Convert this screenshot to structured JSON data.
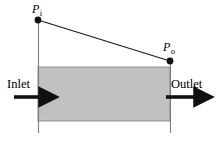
{
  "figure": {
    "title": "",
    "labels": {
      "pressure_inlet": "P",
      "pressure_inlet_sub": "i",
      "pressure_outlet": "P",
      "pressure_outlet_sub": "o",
      "inlet": "Inlet",
      "outlet": "Outlet"
    },
    "colors": {
      "duct_fill": "#b9b9b9",
      "duct_edge": "#8a8a8a",
      "line": "#1a1a1a",
      "background": "#ffffff"
    },
    "geometry": {
      "duct_left_x": 38,
      "duct_right_x": 170,
      "duct_top_y": 67,
      "duct_bottom_y": 121,
      "wall_line_top_y": 20,
      "wall_line_bottom_y": 133,
      "pressure_inlet_point": [
        38,
        20
      ],
      "pressure_outlet_point": [
        170,
        61
      ],
      "inlet_arrow": [
        14,
        97,
        45
      ],
      "outlet_arrow": [
        166,
        97,
        201
      ],
      "dot_radius": 3.2
    }
  }
}
